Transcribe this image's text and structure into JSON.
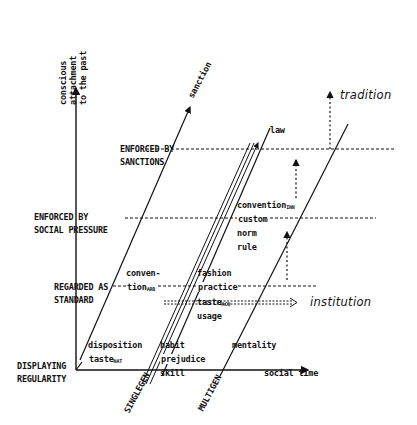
{
  "axes": {
    "vertical_label_lines": [
      "conscious",
      "attachment",
      "to the past"
    ],
    "horizontal_label": "social time"
  },
  "levels": [
    {
      "lines": [
        "ENFORCED BY",
        "SANCTIONS"
      ]
    },
    {
      "lines": [
        "ENFORCED BY",
        "SOCIAL PRESSURE"
      ]
    },
    {
      "lines": [
        "REGARDED AS",
        "STANDARD"
      ]
    },
    {
      "lines": [
        "DISPLAYING",
        "REGULARITY"
      ]
    }
  ],
  "diagonals": {
    "sanction": "sanction",
    "singlegen": "SINGLEGEN",
    "multigen": "MULTIGEN"
  },
  "terms": {
    "law": "law",
    "convention_inn": "convention",
    "convention_inn_sub": "INN",
    "custom": "custom",
    "norm": "norm",
    "rule": "rule",
    "fashion": "fashion",
    "practice": "practice",
    "taste_acq": "taste",
    "taste_acq_sub": "ACQ",
    "usage": "usage",
    "conven": "conven-",
    "tion_arb": "tion",
    "tion_arb_sub": "ARB",
    "disposition": "disposition",
    "taste_nat": "taste",
    "taste_nat_sub": "NAT",
    "habit": "habit",
    "prejudice": "prejudice",
    "skill": "skill",
    "mentality": "mentality"
  },
  "outcomes": {
    "tradition": "tradition",
    "institution": "institution"
  },
  "colors": {
    "ink": "#111111",
    "background": "#ffffff"
  }
}
